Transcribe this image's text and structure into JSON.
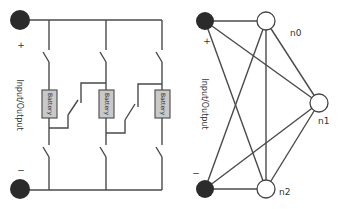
{
  "left_diagram": {
    "plus_label": "+",
    "minus_label": "−",
    "io_label": "Input/Output",
    "battery_labels": [
      "Battery",
      "Battery",
      "Battery"
    ]
  },
  "right_diagram": {
    "plus_label": "+",
    "minus_label": "−",
    "io_label": "Input/Output",
    "nodes": [
      "n0",
      "n1",
      "n2"
    ]
  },
  "colors": {
    "wire": "#4a4a4a",
    "terminal": "#2b2b2b",
    "battery_fill": "#c9c9c9"
  }
}
